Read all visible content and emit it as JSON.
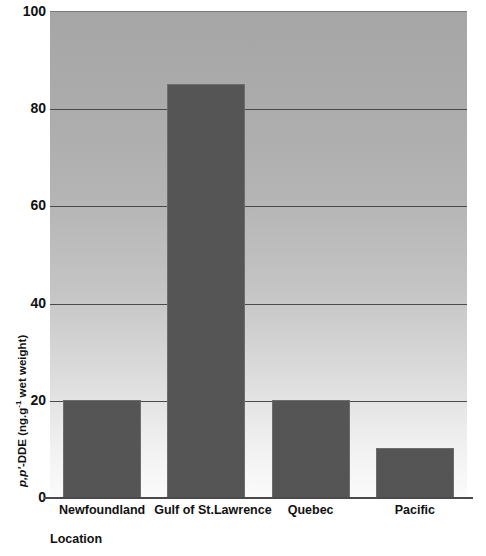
{
  "chart_data": {
    "type": "bar",
    "title": "",
    "categories": [
      "Newfoundland",
      "Gulf of St.Lawrence",
      "Quebec",
      "Pacific"
    ],
    "values": [
      20,
      85,
      20,
      10
    ],
    "series": [
      {
        "name": "p,p'-DDE",
        "values": [
          20,
          85,
          20,
          10
        ]
      }
    ],
    "xlabel": "Location",
    "ylabel": "p,p'-DDE (ng.g-1 wet weight)",
    "ylabel_parts": {
      "italic_prefix": "p,p'",
      "rest": "-DDE (ng.g",
      "exponent": "-1",
      "tail": " wet weight)"
    },
    "ylim": [
      0,
      100
    ],
    "yticks": [
      0,
      20,
      40,
      60,
      80,
      100
    ],
    "ytick_labels": [
      "0",
      "20",
      "40",
      "60",
      "80",
      "100"
    ],
    "grid": true,
    "grid_axis": "y",
    "legend": "none",
    "bar_color": "#555555",
    "plot_bg_top_color": "#a6a6a6",
    "plot_bg_bottom_color": "#fbfbfb",
    "gridline_color": "#4a4a4a",
    "text_color": "#111111"
  },
  "figure": {
    "cropped_title_text": ""
  }
}
